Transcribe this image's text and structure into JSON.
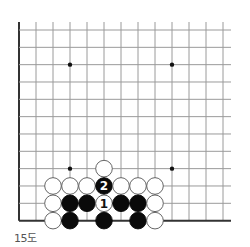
{
  "diagram": {
    "caption": "15도",
    "board": {
      "origin_x": 19,
      "origin_y": 30,
      "spacing_x": 17,
      "spacing_y": 17.33,
      "columns": 13,
      "rows": 12,
      "line_extend_right": 231,
      "left_edge": true,
      "bottom_edge": true,
      "line_color": "#9a9a9a",
      "edge_color": "#333333",
      "hoshi": [
        {
          "col": 3,
          "row": 2
        },
        {
          "col": 9,
          "row": 2
        },
        {
          "col": 3,
          "row": 8
        },
        {
          "col": 9,
          "row": 8
        }
      ]
    },
    "stones": [
      {
        "color": "white",
        "col": 5,
        "row": 8,
        "label": ""
      },
      {
        "color": "white",
        "col": 2,
        "row": 9,
        "label": ""
      },
      {
        "color": "white",
        "col": 3,
        "row": 9,
        "label": ""
      },
      {
        "color": "white",
        "col": 4,
        "row": 9,
        "label": ""
      },
      {
        "color": "black",
        "col": 5,
        "row": 9,
        "label": "2"
      },
      {
        "color": "white",
        "col": 6,
        "row": 9,
        "label": ""
      },
      {
        "color": "white",
        "col": 7,
        "row": 9,
        "label": ""
      },
      {
        "color": "white",
        "col": 8,
        "row": 9,
        "label": ""
      },
      {
        "color": "white",
        "col": 2,
        "row": 10,
        "label": ""
      },
      {
        "color": "black",
        "col": 3,
        "row": 10,
        "label": ""
      },
      {
        "color": "black",
        "col": 4,
        "row": 10,
        "label": ""
      },
      {
        "color": "white",
        "col": 5,
        "row": 10,
        "label": "1"
      },
      {
        "color": "black",
        "col": 6,
        "row": 10,
        "label": ""
      },
      {
        "color": "black",
        "col": 7,
        "row": 10,
        "label": ""
      },
      {
        "color": "white",
        "col": 8,
        "row": 10,
        "label": ""
      },
      {
        "color": "white",
        "col": 2,
        "row": 11,
        "label": ""
      },
      {
        "color": "black",
        "col": 3,
        "row": 11,
        "label": ""
      },
      {
        "color": "black",
        "col": 5,
        "row": 11,
        "label": ""
      },
      {
        "color": "black",
        "col": 7,
        "row": 11,
        "label": ""
      },
      {
        "color": "white",
        "col": 8,
        "row": 11,
        "label": ""
      }
    ]
  }
}
